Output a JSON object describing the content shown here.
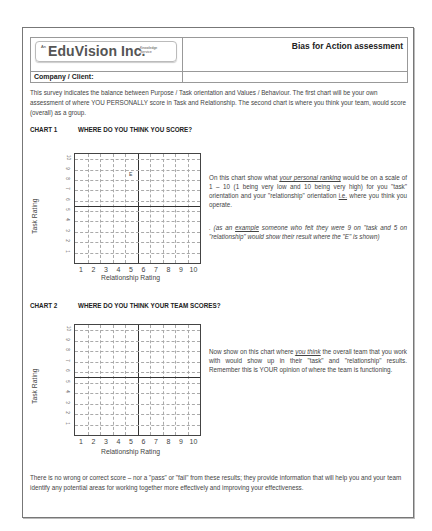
{
  "header": {
    "logo": {
      "prefix": "An",
      "name": "EduVision Inc.",
      "tagline_line1": "Knowledge",
      "tagline_line2": "Service"
    },
    "title": "Bias for Action assessment",
    "company_label": "Company / Client:"
  },
  "intro": "This survey indicates the balance between Purpose / Task orientation and Values / Behaviour. The first chart will be your own assessment of where YOU PERSONALLY score in Task and Relationship. The second chart is where you think your team, would score (overall) as a group.",
  "chart1": {
    "number": "CHART 1",
    "question": "WHERE DO YOU THINK YOU SCORE?",
    "ylabel": "Task Rating",
    "xlabel": "Relationship Rating",
    "x_ticks": [
      "1",
      "2",
      "3",
      "4",
      "5",
      "6",
      "7",
      "8",
      "9",
      "10"
    ],
    "y_ticks": [
      "1",
      "2",
      "3",
      "4",
      "5",
      "6",
      "7",
      "8",
      "9",
      "10"
    ],
    "example_mark": "E",
    "desc_a": "On this chart show what ",
    "desc_u": "your personal ranking",
    "desc_b": " would be on a scale of 1 – 10 (1 being very low and 10 being very high) for you \"task\" orientation and your \"relationship\" orientation ",
    "desc_ie": "i.e.",
    "desc_c": " where you think you operate.",
    "example_a": ". (as an ",
    "example_u": "example",
    "example_b": " someone who felt they were 9 on \"task and 5 on \"relationship\" would show their result where the \"E\" is shown)"
  },
  "chart2": {
    "number": "CHART 2",
    "question": "WHERE DO YOU THINK YOUR TEAM SCORES?",
    "ylabel": "Task Rating",
    "xlabel": "Relationship Rating",
    "x_ticks": [
      "1",
      "2",
      "3",
      "4",
      "5",
      "6",
      "7",
      "8",
      "9",
      "10"
    ],
    "y_ticks": [
      "1",
      "2",
      "3",
      "4",
      "5",
      "6",
      "7",
      "8",
      "9",
      "10"
    ],
    "desc_a": "Now show on this chart where ",
    "desc_u": "you think",
    "desc_b": " the overall team that you work with would show up in their \"task\" and \"relationship\" results. Remember this is YOUR opinion of where the team is functioning."
  },
  "footer": "There is no wrong or correct score – nor a \"pass\" or \"fail\" from these results; they provide information that will help you and your team identify any potential areas for working together more effectively and improving your effectiveness."
}
